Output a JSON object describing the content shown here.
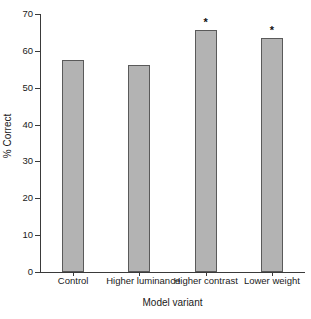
{
  "chart_data": {
    "type": "bar",
    "title": "",
    "xlabel": "Model variant",
    "ylabel": "% Correct",
    "categories": [
      "Control",
      "Higher luminance",
      "Higher contrast",
      "Lower weight"
    ],
    "values": [
      57.5,
      56.1,
      65.7,
      63.5
    ],
    "annotations": [
      {
        "category": "Higher contrast",
        "text": "*"
      },
      {
        "category": "Lower weight",
        "text": "*"
      }
    ],
    "ylim": [
      0,
      70
    ],
    "yticks": [
      0,
      10,
      20,
      30,
      40,
      50,
      60,
      70
    ],
    "ytick_labels": [
      "0",
      "10",
      "20",
      "30",
      "40",
      "50",
      "60",
      "70"
    ],
    "grid": false,
    "legend": false,
    "bar_fill_color": "#b3b3b3",
    "bar_edge_color": "#5a5a5a",
    "axis_color": "#3a3a3a"
  }
}
